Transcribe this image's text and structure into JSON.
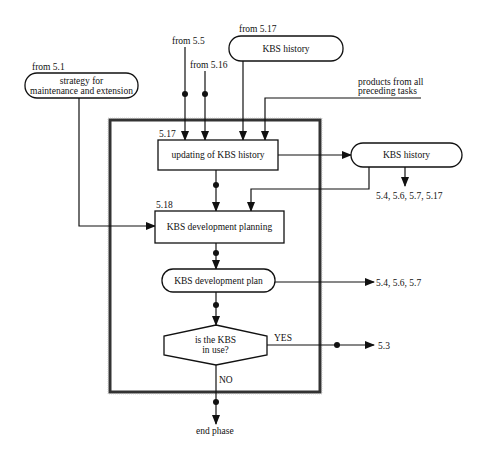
{
  "diagram": {
    "inputs": {
      "from_5_1": "from 5.1",
      "strategy_line1": "strategy for",
      "strategy_line2": "maintenance and extension",
      "from_5_5": "from 5.5",
      "from_5_16": "from 5.16",
      "from_5_17": "from 5.17",
      "kbs_history_in": "KBS history",
      "products_line1": "products from all",
      "products_line2": "preceding tasks"
    },
    "tasks": {
      "update_id": "5.17",
      "update_label": "updating of  KBS history",
      "planning_id": "5.18",
      "planning_label": "KBS development planning"
    },
    "products": {
      "kbs_history_out": "KBS history",
      "kbs_history_targets": "5.4, 5.6, 5.7, 5.17",
      "dev_plan": "KBS development plan",
      "dev_plan_targets": "5.4, 5.6, 5.7"
    },
    "decision": {
      "line1": "is the KBS",
      "line2": "in  use?",
      "yes": "YES",
      "yes_target": "5.3",
      "no": "NO",
      "no_target": "end phase"
    },
    "colors": {
      "line": "#111111",
      "frame": "#333333",
      "background": "#ffffff"
    }
  }
}
